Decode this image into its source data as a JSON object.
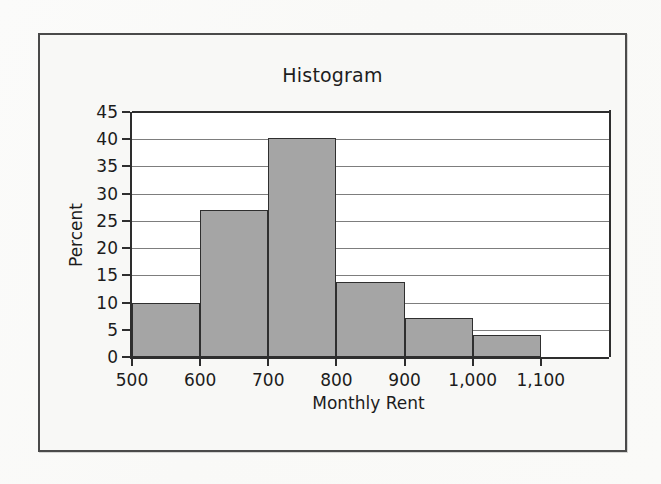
{
  "figure": {
    "title": "Histogram",
    "frame_color": "#4a4a4a",
    "background_color": "#f8f8f6",
    "plot_background": "#ffffff"
  },
  "chart_data": {
    "type": "bar",
    "title": "Histogram",
    "xlabel": "Monthly Rent",
    "ylabel": "Percent",
    "bar_color": "#a5a5a5",
    "bar_edge_color": "#2f2f2f",
    "grid": true,
    "grid_axis": "y",
    "legend": false,
    "xlim": [
      500,
      1200
    ],
    "ylim": [
      0,
      45
    ],
    "xticks": [
      500,
      600,
      700,
      800,
      900,
      1000,
      1100
    ],
    "xtick_labels": [
      "500",
      "600",
      "700",
      "800",
      "900",
      "1,000",
      "1,100"
    ],
    "yticks": [
      0,
      5,
      10,
      15,
      20,
      25,
      30,
      35,
      40,
      45
    ],
    "ytick_labels": [
      "0",
      "5",
      "10",
      "15",
      "20",
      "25",
      "30",
      "35",
      "40",
      "45"
    ],
    "bin_width": 100,
    "bins": [
      {
        "left": 500,
        "right": 600,
        "value": 10.0
      },
      {
        "left": 600,
        "right": 700,
        "value": 27.0
      },
      {
        "left": 700,
        "right": 800,
        "value": 40.2
      },
      {
        "left": 800,
        "right": 900,
        "value": 13.8
      },
      {
        "left": 900,
        "right": 1000,
        "value": 7.2
      },
      {
        "left": 1000,
        "right": 1100,
        "value": 4.0
      }
    ],
    "categories": [
      "500-600",
      "600-700",
      "700-800",
      "800-900",
      "900-1000",
      "1000-1100"
    ],
    "values": [
      10.0,
      27.0,
      40.2,
      13.8,
      7.2,
      4.0
    ]
  }
}
